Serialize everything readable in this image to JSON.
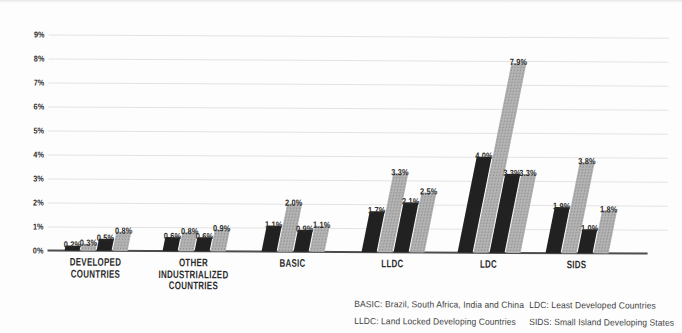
{
  "chart_data": {
    "type": "bar",
    "title": "",
    "xlabel": "",
    "ylabel": "",
    "categories": [
      "DEVELOPED COUNTRIES",
      "OTHER INDUSTRIALIZED COUNTRIES",
      "BASIC",
      "LLDC",
      "LDC",
      "SIDS"
    ],
    "category_label_lines": [
      [
        "DEVELOPED",
        "COUNTRIES"
      ],
      [
        "OTHER",
        "INDUSTRIALIZED",
        "COUNTRIES"
      ],
      [
        "BASIC"
      ],
      [
        "LLDC"
      ],
      [
        "LDC"
      ],
      [
        "SIDS"
      ]
    ],
    "series": [
      {
        "name": "bar-1",
        "color_key": "dark",
        "values": [
          0.2,
          0.6,
          1.1,
          1.7,
          4.0,
          1.9
        ],
        "value_labels": [
          "0.2%",
          "0.6%",
          "1.1%",
          "1.7%",
          "4.0%",
          "1.9%"
        ]
      },
      {
        "name": "bar-2",
        "color_key": "gray",
        "values": [
          0.3,
          0.8,
          2.0,
          3.3,
          7.9,
          3.8
        ],
        "value_labels": [
          "0.3%",
          "0.8%",
          "2.0%",
          "3.3%",
          "7.9%",
          "3.8%"
        ]
      },
      {
        "name": "bar-3",
        "color_key": "dark",
        "values": [
          0.5,
          0.6,
          0.9,
          2.1,
          3.3,
          1.0
        ],
        "value_labels": [
          "0.5%",
          "0.6%",
          "0.9%",
          "2.1%",
          "3.3%",
          "1.0%"
        ]
      },
      {
        "name": "bar-4",
        "color_key": "gray",
        "values": [
          0.8,
          0.9,
          1.1,
          2.5,
          3.3,
          1.8
        ],
        "value_labels": [
          "0.8%",
          "0.9%",
          "1.1%",
          "2.5%",
          "3.3%",
          "1.8%"
        ]
      }
    ],
    "ylim": [
      0,
      9
    ],
    "yticks": [
      "0%",
      "1%",
      "2%",
      "3%",
      "4%",
      "5%",
      "6%",
      "7%",
      "8%",
      "9%"
    ],
    "grid": true,
    "legend_position": "none",
    "colors": {
      "dark": "#212121",
      "gray": "#a8a8a8",
      "gridline": "#e3e3e3",
      "axis": "#4d4d4d",
      "label_text": "#2b2b2b",
      "footnote_text": "#3f3f3f"
    }
  },
  "footnotes": {
    "col1": [
      "BASIC: Brazil, South Africa, India and China",
      "LLDC: Land Locked Developing Countries"
    ],
    "col2": [
      "LDC: Least Developed Countries",
      "SIDS: Small Island Developing States"
    ]
  }
}
